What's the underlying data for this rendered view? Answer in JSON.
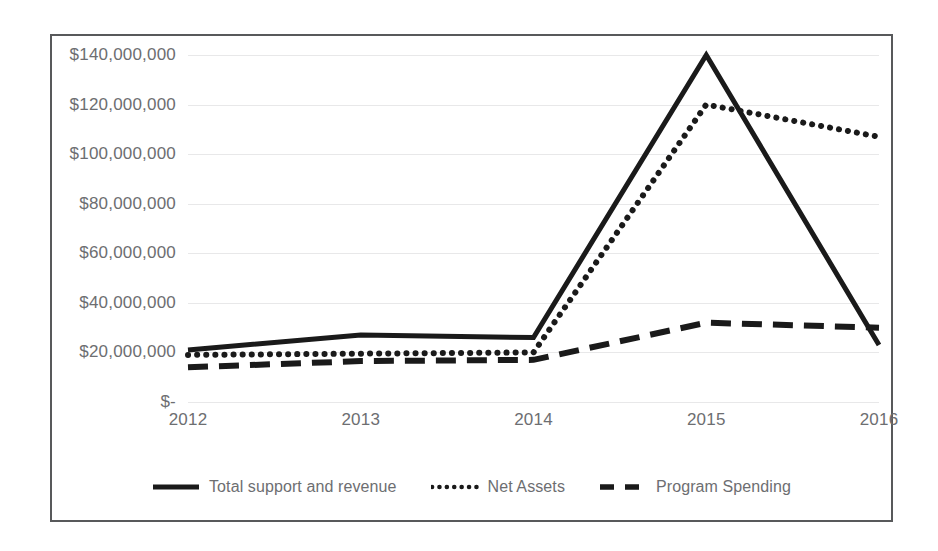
{
  "chart_data": {
    "type": "line",
    "title": "",
    "subtitle": "",
    "xlabel": "",
    "ylabel": "",
    "categories": [
      "2012",
      "2013",
      "2014",
      "2015",
      "2016"
    ],
    "ytick_labels": [
      "$140,000,000",
      "$120,000,000",
      "$100,000,000",
      "$80,000,000",
      "$60,000,000",
      "$40,000,000",
      "$20,000,000",
      "$-"
    ],
    "ytick_values": [
      140000000,
      120000000,
      100000000,
      80000000,
      60000000,
      40000000,
      20000000,
      0
    ],
    "ylim": [
      0,
      140000000
    ],
    "ytick_step": 20000000,
    "grid": true,
    "legend_position": "bottom",
    "series": [
      {
        "name": "Total support and revenue",
        "style": "solid",
        "color": "#1a1a1a",
        "values": [
          21000000,
          27000000,
          26000000,
          140000000,
          23000000
        ]
      },
      {
        "name": "Net Assets",
        "style": "dotted",
        "color": "#1a1a1a",
        "values": [
          19000000,
          19500000,
          20000000,
          120000000,
          107000000
        ]
      },
      {
        "name": "Program Spending",
        "style": "dashed",
        "color": "#1a1a1a",
        "values": [
          14000000,
          16500000,
          17000000,
          32000000,
          30000000
        ]
      }
    ]
  },
  "legend": {
    "items": [
      {
        "label": "Total support and revenue",
        "style": "solid"
      },
      {
        "label": "Net Assets",
        "style": "dotted"
      },
      {
        "label": "Program Spending",
        "style": "dashed"
      }
    ]
  },
  "colors": {
    "series": "#1a1a1a",
    "gridline": "#e8e8e9",
    "axis_text": "#6d6e71",
    "frame": "#58595b",
    "background": "#ffffff"
  }
}
